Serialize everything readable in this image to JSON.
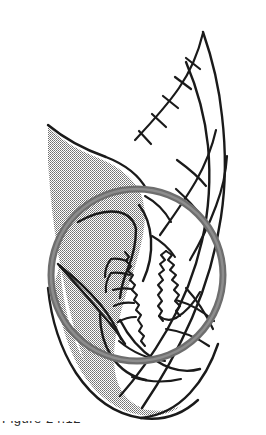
{
  "figure": {
    "medium": "scanned halftone line drawing",
    "background_color": "#ffffff",
    "ink_color": "#1a1a1a",
    "shading_color": "#a8a8a8",
    "callout_color": "#6e6e6e",
    "canvas": {
      "width": 266,
      "height": 435
    }
  },
  "callout": {
    "shape": "circle",
    "center_x": 137,
    "center_y": 275,
    "radius": 86,
    "stroke_width": 7,
    "color": "#6e6e6e",
    "label": "detail-circle"
  },
  "shaded_region": {
    "label": "shaded-lobe",
    "fill": "#a8a8a8",
    "description": "large gray halftone lobe on the left side running from upper-left point down to bottom lobe"
  },
  "serrations": [
    {
      "label": "left-serrated-margin",
      "x": 120,
      "y": 275,
      "description": "jagged comb-toothed torn edge on the gray lobe"
    },
    {
      "label": "right-serrated-margin",
      "x": 175,
      "y": 280,
      "description": "jagged zigzag torn edge on the right band"
    }
  ],
  "vein_ticks": {
    "label": "branching-tick-marks",
    "count": 5,
    "description": "short oblique tick branches along the upper arc"
  },
  "caption": {
    "text": "Figure 24.12",
    "visible": "top sliver only, cropped at image bottom edge"
  }
}
